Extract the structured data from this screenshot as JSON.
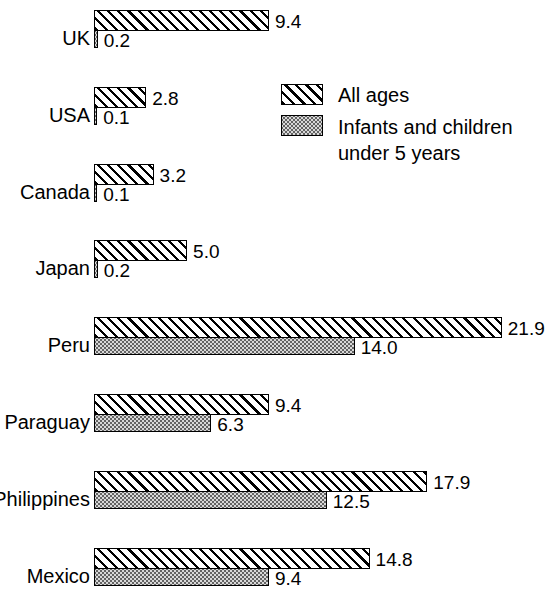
{
  "chart_data": {
    "type": "bar",
    "orientation": "horizontal",
    "title": "",
    "subtitle": "",
    "xlabel": "",
    "ylabel": "",
    "grid": false,
    "axis_visible": false,
    "xlim": [
      0,
      21.9
    ],
    "legend_position": "upper-right",
    "categories": [
      "UK",
      "USA",
      "Canada",
      "Japan",
      "Peru",
      "Paraguay",
      "Philippines",
      "Mexico"
    ],
    "series": [
      {
        "name": "All ages",
        "fill": "diagonal-hatch",
        "values": [
          9.4,
          2.8,
          3.2,
          5.0,
          21.9,
          9.4,
          17.9,
          14.8
        ],
        "labels": [
          "9.4",
          "2.8",
          "3.2",
          "5.0",
          "21.9",
          "9.4",
          "17.9",
          "14.8"
        ]
      },
      {
        "name": "Infants and children under 5 years",
        "fill": "stipple",
        "values": [
          0.2,
          0.1,
          0.1,
          0.2,
          14.0,
          6.3,
          12.5,
          9.4
        ],
        "labels": [
          "0.2",
          "0.1",
          "0.1",
          "0.2",
          "14.0",
          "6.3",
          "12.5",
          "9.4"
        ]
      }
    ],
    "legend": [
      {
        "label": "All ages",
        "fill": "diagonal-hatch"
      },
      {
        "label": "Infants and children\nunder 5 years",
        "fill": "stipple"
      }
    ],
    "colors": {
      "background": "#ffffff",
      "outline": "#000000",
      "hatch": "#000000",
      "stipple_fill": "#d8d8d8",
      "stipple_dot": "#5a5a5a",
      "text": "#000000"
    }
  },
  "rows": [
    {
      "label": "UK",
      "all_label": "9.4",
      "inf_label": "0.2"
    },
    {
      "label": "USA",
      "all_label": "2.8",
      "inf_label": "0.1"
    },
    {
      "label": "Canada",
      "all_label": "3.2",
      "inf_label": "0.1"
    },
    {
      "label": "Japan",
      "all_label": "5.0",
      "inf_label": "0.2"
    },
    {
      "label": "Peru",
      "all_label": "21.9",
      "inf_label": "14.0"
    },
    {
      "label": "Paraguay",
      "all_label": "9.4",
      "inf_label": "6.3"
    },
    {
      "label": "Philippines",
      "all_label": "17.9",
      "inf_label": "12.5"
    },
    {
      "label": "Mexico",
      "all_label": "14.8",
      "inf_label": "9.4"
    }
  ],
  "legend": {
    "all_ages_label": "All ages",
    "infants_line1": "Infants and children",
    "infants_line2": "under 5 years"
  }
}
